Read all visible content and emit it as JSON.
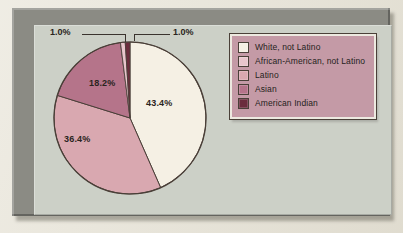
{
  "figure": {
    "frame_color": "#8b8b84",
    "plate_color": "#ccd0c7",
    "legend_bg": "#c49aa6"
  },
  "chart_data": {
    "type": "pie",
    "title": "",
    "subtitle": "",
    "xlabel": "",
    "ylabel": "",
    "grid": false,
    "legend_position": "right",
    "start_angle_deg": 0,
    "direction": "clockwise",
    "units": "percent",
    "categories": [
      "White, not Latino",
      "African-American, not Latino",
      "Latino",
      "Asian",
      "American Indian"
    ],
    "values": [
      43.4,
      1.0,
      36.4,
      18.2,
      1.0
    ],
    "value_labels": [
      "43.4%",
      "1.0%",
      "36.4%",
      "18.2%",
      "1.0%"
    ],
    "colors": [
      "#f5f0e4",
      "#e8c6cc",
      "#d9a8b0",
      "#b5748a",
      "#6b2d3d"
    ],
    "slices": [
      {
        "label": "White, not Latino",
        "value": 43.4,
        "display": "43.4%",
        "color": "#f5f0e4",
        "label_placement": "inside"
      },
      {
        "label": "African-American, not Latino",
        "value": 1.0,
        "display": "1.0%",
        "color": "#e8c6cc",
        "label_placement": "callout-right"
      },
      {
        "label": "Latino",
        "value": 36.4,
        "display": "36.4%",
        "color": "#d9a8b0",
        "label_placement": "inside"
      },
      {
        "label": "Asian",
        "value": 18.2,
        "display": "18.2%",
        "color": "#b5748a",
        "label_placement": "inside"
      },
      {
        "label": "American Indian",
        "value": 1.0,
        "display": "1.0%",
        "color": "#6b2d3d",
        "label_placement": "callout-left"
      }
    ]
  },
  "pie_labels": {
    "white": "43.4%",
    "latino": "36.4%",
    "asian": "18.2%",
    "callout_left": "1.0%",
    "callout_right": "1.0%"
  },
  "legend": {
    "items": [
      {
        "label": "White, not Latino",
        "color": "#f5f0e4"
      },
      {
        "label": "African-American, not Latino",
        "color": "#e8c6cc"
      },
      {
        "label": "Latino",
        "color": "#d9a8b0"
      },
      {
        "label": "Asian",
        "color": "#b5748a"
      },
      {
        "label": "American Indian",
        "color": "#6b2d3d"
      }
    ]
  }
}
